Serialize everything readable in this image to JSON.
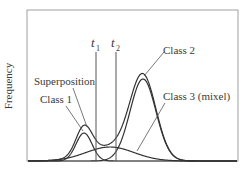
{
  "chart_data": {
    "type": "line",
    "title": "",
    "xlabel": "",
    "ylabel": "Frequency",
    "grid": false,
    "legend": "none (direct annotation labels with leader lines)",
    "series": [
      {
        "name": "Class 1",
        "kind": "gaussian",
        "mean_px": 84,
        "sigma_px": 8,
        "peak": 28
      },
      {
        "name": "Class 2",
        "kind": "gaussian",
        "mean_px": 143,
        "sigma_px": 13,
        "peak": 82
      },
      {
        "name": "Class 3 (mixel)",
        "kind": "gaussian",
        "mean_px": 110,
        "sigma_px": 24,
        "peak": 14
      },
      {
        "name": "Superposition",
        "kind": "sum",
        "of": [
          "Class 1",
          "Class 2",
          "Class 3 (mixel)"
        ]
      }
    ],
    "thresholds": [
      {
        "label": "t",
        "subscript": "1",
        "x_px": 96
      },
      {
        "label": "t",
        "subscript": "2",
        "x_px": 116
      }
    ],
    "annotations": [
      "Superposition",
      "Class 1",
      "Class 2",
      "Class 3 (mixel)"
    ]
  },
  "labels": {
    "ylabel": "Frequency",
    "t1_main": "t",
    "t1_sub": "1",
    "t2_main": "t",
    "t2_sub": "2",
    "superposition": "Superposition",
    "class1": "Class 1",
    "class2": "Class 2",
    "class3": "Class 3 (mixel)"
  },
  "colors": {
    "frame": "#9a9a9a",
    "curve": "#333333",
    "threshold": "#555555",
    "leader": "#555555",
    "text": "#3a3a3a"
  }
}
